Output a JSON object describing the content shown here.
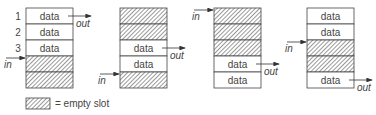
{
  "caption_partial": "… buffer at different stages of use",
  "slot_label": "data",
  "in_label": "in",
  "out_label": "out",
  "row_numbers": [
    "1",
    "2",
    "3"
  ],
  "legend": {
    "text": "= empty slot"
  },
  "stacks": [
    {
      "slots": [
        "data",
        "data",
        "data",
        "empty",
        "empty"
      ],
      "in_slot": 3,
      "out_slot": 0
    },
    {
      "slots": [
        "empty",
        "empty",
        "data",
        "data",
        "empty"
      ],
      "in_slot": 4,
      "out_slot": 2
    },
    {
      "slots": [
        "empty",
        "empty",
        "empty",
        "data",
        "data"
      ],
      "in_slot": 0,
      "out_slot": 3
    },
    {
      "slots": [
        "data",
        "data",
        "empty",
        "empty",
        "data"
      ],
      "in_slot": 2,
      "out_slot": 4
    }
  ]
}
